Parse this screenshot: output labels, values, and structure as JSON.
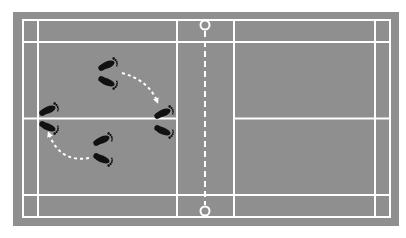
{
  "diagram": {
    "title": "Badminton court footwork diagram",
    "colors": {
      "background": "#ffffff",
      "court_surface": "#8f8f8f",
      "court_lines": "#ffffff",
      "footprints": "#111111",
      "arrows": "#ffffff"
    },
    "court": {
      "surround": {
        "x": 13,
        "y": 12,
        "w": 386,
        "h": 214
      },
      "outer": {
        "x": 23,
        "y": 20,
        "w": 367,
        "h": 197
      },
      "singles_sidelines_x": [
        38,
        375
      ],
      "long_service_lines_y": [
        42,
        195
      ],
      "short_service_lines_x": [
        177,
        234
      ],
      "center_line_y": 118.5,
      "net_x": 205,
      "net_posts": [
        {
          "cx": 205,
          "cy": 25
        },
        {
          "cx": 205,
          "cy": 211
        }
      ]
    },
    "footprint_pairs": [
      {
        "id": "A",
        "label": "start-mid-left",
        "x": 107,
        "y": 74
      },
      {
        "id": "B",
        "label": "front-near-net",
        "x": 163,
        "y": 122
      },
      {
        "id": "C",
        "label": "rear-left",
        "x": 48,
        "y": 118
      },
      {
        "id": "D",
        "label": "mid-bottom",
        "x": 102,
        "y": 149
      }
    ],
    "arrows": [
      {
        "id": "arrow-1",
        "from": "A",
        "to": "B",
        "path": "M122,73 Q148,80 157,101"
      },
      {
        "id": "arrow-2",
        "from": "D",
        "to": "C",
        "path": "M89,158 Q60,163 49,134"
      }
    ]
  }
}
